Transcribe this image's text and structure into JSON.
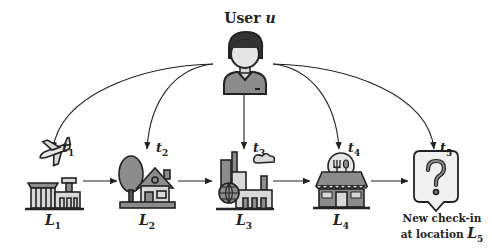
{
  "user": {
    "label": "User",
    "var": "u",
    "icon": "user-avatar-icon"
  },
  "timestamps": [
    {
      "base": "t",
      "sub": "1"
    },
    {
      "base": "t",
      "sub": "2"
    },
    {
      "base": "t",
      "sub": "3"
    },
    {
      "base": "t",
      "sub": "4"
    },
    {
      "base": "t",
      "sub": "5"
    }
  ],
  "locations": [
    {
      "base": "L",
      "sub": "1",
      "icon": "airport-icon"
    },
    {
      "base": "L",
      "sub": "2",
      "icon": "house-icon"
    },
    {
      "base": "L",
      "sub": "3",
      "icon": "city-factory-icon"
    },
    {
      "base": "L",
      "sub": "4",
      "icon": "restaurant-icon"
    },
    {
      "base": "L",
      "sub": "5",
      "icon": "question-bubble-icon"
    }
  ],
  "new_checkin": {
    "line1": "New check-in",
    "line2_prefix": "at location",
    "var_base": "L",
    "var_sub": "5"
  },
  "colors": {
    "line": "#222222",
    "fill_light": "#d9d9d9",
    "fill_mid": "#8c8c8c",
    "fill_dark": "#5a5a5a"
  }
}
